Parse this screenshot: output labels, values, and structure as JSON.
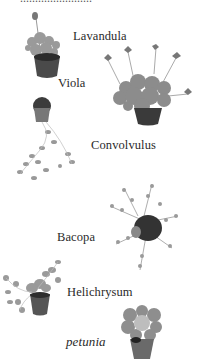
{
  "page": {
    "top_cropped_text": "........................",
    "labels": [
      {
        "id": "lavandula",
        "text": "Lavandula",
        "italic": false
      },
      {
        "id": "viola",
        "text": "Viola",
        "italic": false
      },
      {
        "id": "convolvulus",
        "text": "Convolvulus",
        "italic": false
      },
      {
        "id": "bacopa",
        "text": "Bacopa",
        "italic": false
      },
      {
        "id": "helichrysum",
        "text": "Helichrysum",
        "italic": false
      },
      {
        "id": "petunia",
        "text": "petunia",
        "italic": true
      }
    ]
  },
  "colors": {
    "text": "#2a2a2a",
    "foliage": "#8a8a8a",
    "pot": "#3a3a3a",
    "background": "#ffffff"
  }
}
